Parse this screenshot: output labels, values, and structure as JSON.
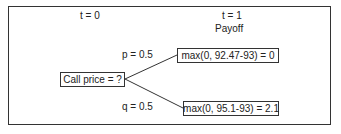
{
  "header": {
    "t0": "t = 0",
    "t1": "t = 1",
    "payoff": "Payoff"
  },
  "root": {
    "label": "Call price = ?"
  },
  "branches": [
    {
      "prob": "p = 0.5",
      "payoff": "max(0, 92.47-93) = 0"
    },
    {
      "prob": "q = 0.5",
      "payoff": "max(0, 95.1-93) = 2.1"
    }
  ]
}
